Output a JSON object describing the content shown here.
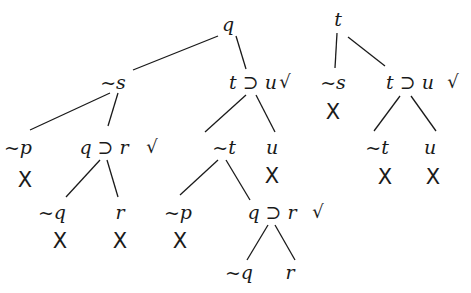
{
  "diagram": {
    "type": "truth-tree",
    "trees": [
      {
        "id": "left",
        "nodes": [
          {
            "id": "L1",
            "label": "q",
            "x": 228,
            "y": 24
          },
          {
            "id": "L2",
            "label": "~s",
            "x": 113,
            "y": 82
          },
          {
            "id": "L3",
            "label": "t ⊃ u",
            "x": 253,
            "y": 82,
            "checked": true
          },
          {
            "id": "L4",
            "label": "~p",
            "x": 18,
            "y": 147,
            "closed": true
          },
          {
            "id": "L5",
            "label": "q ⊃ r",
            "x": 104,
            "y": 147,
            "checked": true
          },
          {
            "id": "L6",
            "label": "~t",
            "x": 224,
            "y": 147
          },
          {
            "id": "L7",
            "label": "u",
            "x": 272,
            "y": 147,
            "closed": true
          },
          {
            "id": "L8",
            "label": "~q",
            "x": 52,
            "y": 212,
            "closed": true
          },
          {
            "id": "L9",
            "label": "r",
            "x": 120,
            "y": 212,
            "closed": true
          },
          {
            "id": "L10",
            "label": "~p",
            "x": 178,
            "y": 212,
            "closed": true
          },
          {
            "id": "L11",
            "label": "q ⊃ r",
            "x": 272,
            "y": 212,
            "checked": true
          },
          {
            "id": "L12",
            "label": "~q",
            "x": 239,
            "y": 272
          },
          {
            "id": "L13",
            "label": "r",
            "x": 290,
            "y": 272
          }
        ],
        "edges": [
          {
            "x1": 218,
            "y1": 36,
            "x2": 133,
            "y2": 70
          },
          {
            "x1": 236,
            "y1": 36,
            "x2": 246,
            "y2": 69
          },
          {
            "x1": 110,
            "y1": 93,
            "x2": 30,
            "y2": 130
          },
          {
            "x1": 118,
            "y1": 93,
            "x2": 108,
            "y2": 126
          },
          {
            "x1": 100,
            "y1": 160,
            "x2": 66,
            "y2": 197
          },
          {
            "x1": 107,
            "y1": 160,
            "x2": 118,
            "y2": 197
          },
          {
            "x1": 246,
            "y1": 95,
            "x2": 205,
            "y2": 132
          },
          {
            "x1": 256,
            "y1": 95,
            "x2": 275,
            "y2": 132
          },
          {
            "x1": 218,
            "y1": 160,
            "x2": 180,
            "y2": 195
          },
          {
            "x1": 226,
            "y1": 160,
            "x2": 250,
            "y2": 200
          },
          {
            "x1": 268,
            "y1": 225,
            "x2": 247,
            "y2": 260
          },
          {
            "x1": 275,
            "y1": 225,
            "x2": 295,
            "y2": 260
          }
        ],
        "checks": [
          {
            "x": 285,
            "y": 82
          },
          {
            "x": 152,
            "y": 147
          },
          {
            "x": 318,
            "y": 212
          }
        ],
        "crosses": [
          {
            "x": 25,
            "y": 180
          },
          {
            "x": 272,
            "y": 176
          },
          {
            "x": 60,
            "y": 241
          },
          {
            "x": 120,
            "y": 241
          },
          {
            "x": 180,
            "y": 241
          }
        ]
      },
      {
        "id": "right",
        "nodes": [
          {
            "id": "R1",
            "label": "t",
            "x": 338,
            "y": 19
          },
          {
            "id": "R2",
            "label": "~s",
            "x": 333,
            "y": 82,
            "closed": true
          },
          {
            "id": "R3",
            "label": "t ⊃ u",
            "x": 410,
            "y": 82,
            "checked": true
          },
          {
            "id": "R4",
            "label": "~t",
            "x": 377,
            "y": 147,
            "closed": true
          },
          {
            "id": "R5",
            "label": "u",
            "x": 430,
            "y": 147,
            "closed": true
          }
        ],
        "edges": [
          {
            "x1": 337,
            "y1": 33,
            "x2": 335,
            "y2": 68
          },
          {
            "x1": 348,
            "y1": 37,
            "x2": 385,
            "y2": 66
          },
          {
            "x1": 400,
            "y1": 96,
            "x2": 374,
            "y2": 131
          },
          {
            "x1": 411,
            "y1": 96,
            "x2": 436,
            "y2": 131
          }
        ],
        "checks": [
          {
            "x": 453,
            "y": 82
          }
        ],
        "crosses": [
          {
            "x": 333,
            "y": 112
          },
          {
            "x": 385,
            "y": 177
          },
          {
            "x": 433,
            "y": 177
          }
        ]
      }
    ],
    "symbols": {
      "check": "√",
      "cross": "X",
      "negation": "~",
      "conditional": "⊃"
    },
    "colors": {
      "ink": "#1a1a1a",
      "background": "#ffffff"
    }
  }
}
